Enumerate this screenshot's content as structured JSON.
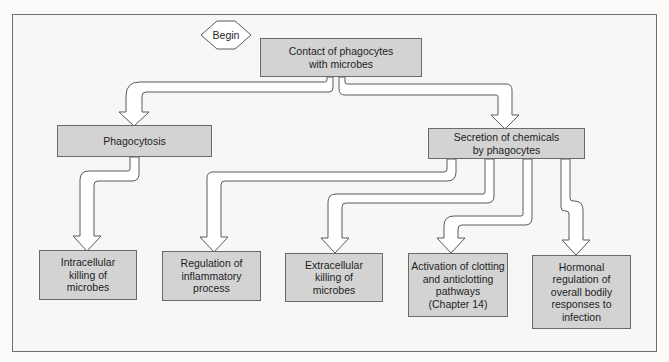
{
  "diagram": {
    "type": "flowchart",
    "start_label": "Begin",
    "nodes": {
      "contact": "Contact of phagocytes\nwith microbes",
      "phagocytosis": "Phagocytosis",
      "secretion": "Secretion of chemicals\nby phagocytes",
      "intracellular": "Intracellular\nkilling of\nmicrobes",
      "inflammatory": "Regulation of\ninflammatory\nprocess",
      "extracellular": "Extracellular\nkilling of\nmicrobes",
      "clotting": "Activation of clotting\nand anticlotting\npathways\n(Chapter 14)",
      "hormonal": "Hormonal\nregulation of\noverall bodily\nresponses to\ninfection"
    },
    "edges": [
      {
        "from": "contact",
        "to": "phagocytosis"
      },
      {
        "from": "contact",
        "to": "secretion"
      },
      {
        "from": "phagocytosis",
        "to": "intracellular"
      },
      {
        "from": "secretion",
        "to": "inflammatory"
      },
      {
        "from": "secretion",
        "to": "extracellular"
      },
      {
        "from": "secretion",
        "to": "clotting"
      },
      {
        "from": "secretion",
        "to": "hormonal"
      }
    ],
    "colors": {
      "box_fill": "#d3d3d3",
      "box_border": "#6a6a6a",
      "arrow_fill": "#ffffff",
      "arrow_stroke": "#5a5a5a",
      "frame_border": "#6f6f6f"
    }
  }
}
